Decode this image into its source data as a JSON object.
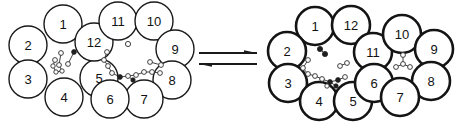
{
  "figure": {
    "kind": "chemical-equilibrium-diagram",
    "background_color": "#ffffff",
    "ink_color": "#111111"
  },
  "equilibrium": {
    "name": "equilibrium-arrows",
    "forward_arrow_label": "",
    "reverse_arrow_label": "",
    "forward_direction": "right",
    "reverse_direction": "left",
    "arrow_color": "#1a1a1a"
  },
  "left_cluster": {
    "name": "left-structure",
    "stroke_width": 1.4,
    "stroke_color": "#1a1a1a",
    "fill_color": "#ffffff",
    "label_font_size": 13,
    "circles": [
      {
        "label": "1",
        "cx": 63,
        "cy": 24,
        "r": 19
      },
      {
        "label": "2",
        "cx": 28,
        "cy": 45,
        "r": 19
      },
      {
        "label": "3",
        "cx": 28,
        "cy": 79,
        "r": 19
      },
      {
        "label": "4",
        "cx": 64,
        "cy": 97,
        "r": 19
      },
      {
        "label": "5",
        "cx": 99,
        "cy": 78,
        "r": 19
      },
      {
        "label": "12",
        "cx": 94,
        "cy": 42,
        "r": 19
      },
      {
        "label": "11",
        "cx": 118,
        "cy": 21,
        "r": 19
      },
      {
        "label": "10",
        "cx": 154,
        "cy": 21,
        "r": 19
      },
      {
        "label": "9",
        "cx": 175,
        "cy": 49,
        "r": 19
      },
      {
        "label": "8",
        "cx": 172,
        "cy": 80,
        "r": 19
      },
      {
        "label": "7",
        "cx": 144,
        "cy": 99,
        "r": 19
      },
      {
        "label": "6",
        "cx": 110,
        "cy": 99,
        "r": 19
      }
    ]
  },
  "right_cluster": {
    "name": "right-structure",
    "stroke_width": 2.6,
    "stroke_color": "#141414",
    "fill_color": "#ffffff",
    "label_font_size": 13,
    "circles": [
      {
        "label": "1",
        "cx": 315,
        "cy": 26,
        "r": 19
      },
      {
        "label": "12",
        "cx": 351,
        "cy": 25,
        "r": 19
      },
      {
        "label": "2",
        "cx": 287,
        "cy": 51,
        "r": 19
      },
      {
        "label": "3",
        "cx": 288,
        "cy": 83,
        "r": 19
      },
      {
        "label": "4",
        "cx": 319,
        "cy": 101,
        "r": 19
      },
      {
        "label": "5",
        "cx": 353,
        "cy": 101,
        "r": 19
      },
      {
        "label": "11",
        "cx": 373,
        "cy": 52,
        "r": 19
      },
      {
        "label": "6",
        "cx": 374,
        "cy": 83,
        "r": 19
      },
      {
        "label": "10",
        "cx": 402,
        "cy": 34,
        "r": 19
      },
      {
        "label": "9",
        "cx": 434,
        "cy": 49,
        "r": 19
      },
      {
        "label": "8",
        "cx": 431,
        "cy": 81,
        "r": 19
      },
      {
        "label": "7",
        "cx": 400,
        "cy": 97,
        "r": 19
      }
    ]
  },
  "left_cavities": [
    {
      "name": "left-cavity-small",
      "nodes": [
        {
          "x": 61,
          "y": 53,
          "r": 2.4,
          "dark": false
        },
        {
          "x": 74,
          "y": 52,
          "r": 2.4,
          "dark": true
        },
        {
          "x": 55,
          "y": 60,
          "r": 2.4,
          "dark": false
        },
        {
          "x": 59,
          "y": 65,
          "r": 2.4,
          "dark": false
        },
        {
          "x": 53,
          "y": 66,
          "r": 2.2,
          "dark": false
        },
        {
          "x": 68,
          "y": 64,
          "r": 2.4,
          "dark": false
        },
        {
          "x": 56,
          "y": 72,
          "r": 2.2,
          "dark": false
        },
        {
          "x": 62,
          "y": 71,
          "r": 2.2,
          "dark": false
        }
      ],
      "bonds": [
        {
          "x1": 61,
          "y1": 53,
          "x2": 59,
          "y2": 65
        },
        {
          "x1": 74,
          "y1": 52,
          "x2": 68,
          "y2": 64
        },
        {
          "x1": 55,
          "y1": 60,
          "x2": 53,
          "y2": 66
        },
        {
          "x1": 53,
          "y1": 66,
          "x2": 56,
          "y2": 72
        },
        {
          "x1": 56,
          "y1": 72,
          "x2": 62,
          "y2": 71
        },
        {
          "x1": 59,
          "y1": 65,
          "x2": 62,
          "y2": 71
        }
      ]
    },
    {
      "name": "left-cavity-large",
      "nodes": [
        {
          "x": 128,
          "y": 44,
          "r": 2.6,
          "dark": false
        },
        {
          "x": 150,
          "y": 62,
          "r": 2.4,
          "dark": false
        },
        {
          "x": 161,
          "y": 65,
          "r": 2.4,
          "dark": false
        },
        {
          "x": 107,
          "y": 52,
          "r": 2.4,
          "dark": false
        },
        {
          "x": 104,
          "y": 60,
          "r": 2.4,
          "dark": false
        },
        {
          "x": 108,
          "y": 66,
          "r": 2.4,
          "dark": false
        },
        {
          "x": 112,
          "y": 73,
          "r": 2.4,
          "dark": false
        },
        {
          "x": 120,
          "y": 77,
          "r": 2.4,
          "dark": true
        },
        {
          "x": 128,
          "y": 76,
          "r": 2.4,
          "dark": false
        },
        {
          "x": 136,
          "y": 75,
          "r": 2.4,
          "dark": false
        },
        {
          "x": 144,
          "y": 72,
          "r": 2.4,
          "dark": false
        },
        {
          "x": 152,
          "y": 72,
          "r": 2.4,
          "dark": false
        },
        {
          "x": 160,
          "y": 73,
          "r": 2.4,
          "dark": false
        },
        {
          "x": 133,
          "y": 80,
          "r": 2.2,
          "dark": true
        }
      ],
      "bonds": [
        {
          "x1": 107,
          "y1": 52,
          "x2": 104,
          "y2": 60
        },
        {
          "x1": 104,
          "y1": 60,
          "x2": 108,
          "y2": 66
        },
        {
          "x1": 108,
          "y1": 66,
          "x2": 112,
          "y2": 73
        },
        {
          "x1": 112,
          "y1": 73,
          "x2": 120,
          "y2": 77
        },
        {
          "x1": 120,
          "y1": 77,
          "x2": 128,
          "y2": 76
        },
        {
          "x1": 128,
          "y1": 76,
          "x2": 136,
          "y2": 75
        },
        {
          "x1": 136,
          "y1": 75,
          "x2": 144,
          "y2": 72
        },
        {
          "x1": 144,
          "y1": 72,
          "x2": 152,
          "y2": 72
        },
        {
          "x1": 152,
          "y1": 72,
          "x2": 160,
          "y2": 73
        },
        {
          "x1": 150,
          "y1": 62,
          "x2": 161,
          "y2": 65
        },
        {
          "x1": 128,
          "y1": 76,
          "x2": 133,
          "y2": 80
        }
      ]
    }
  ],
  "right_cavities": [
    {
      "name": "right-cavity-large",
      "nodes": [
        {
          "x": 320,
          "y": 49,
          "r": 2.6,
          "dark": true
        },
        {
          "x": 325,
          "y": 54,
          "r": 2.6,
          "dark": true
        },
        {
          "x": 308,
          "y": 60,
          "r": 2.4,
          "dark": false
        },
        {
          "x": 303,
          "y": 68,
          "r": 2.4,
          "dark": false
        },
        {
          "x": 308,
          "y": 74,
          "r": 2.4,
          "dark": false
        },
        {
          "x": 315,
          "y": 76,
          "r": 2.4,
          "dark": false
        },
        {
          "x": 322,
          "y": 79,
          "r": 2.4,
          "dark": false
        },
        {
          "x": 330,
          "y": 82,
          "r": 2.4,
          "dark": true
        },
        {
          "x": 338,
          "y": 80,
          "r": 2.4,
          "dark": true
        },
        {
          "x": 345,
          "y": 77,
          "r": 2.4,
          "dark": false
        },
        {
          "x": 340,
          "y": 66,
          "r": 2.4,
          "dark": false
        },
        {
          "x": 347,
          "y": 63,
          "r": 2.4,
          "dark": false
        },
        {
          "x": 336,
          "y": 86,
          "r": 2.2,
          "dark": true
        },
        {
          "x": 327,
          "y": 86,
          "r": 2.2,
          "dark": false
        }
      ],
      "bonds": [
        {
          "x1": 320,
          "y1": 49,
          "x2": 325,
          "y2": 54
        },
        {
          "x1": 308,
          "y1": 60,
          "x2": 303,
          "y2": 68
        },
        {
          "x1": 303,
          "y1": 68,
          "x2": 308,
          "y2": 74
        },
        {
          "x1": 308,
          "y1": 74,
          "x2": 315,
          "y2": 76
        },
        {
          "x1": 315,
          "y1": 76,
          "x2": 322,
          "y2": 79
        },
        {
          "x1": 322,
          "y1": 79,
          "x2": 330,
          "y2": 82
        },
        {
          "x1": 330,
          "y1": 82,
          "x2": 338,
          "y2": 80
        },
        {
          "x1": 338,
          "y1": 80,
          "x2": 345,
          "y2": 77
        },
        {
          "x1": 340,
          "y1": 66,
          "x2": 347,
          "y2": 63
        },
        {
          "x1": 330,
          "y1": 82,
          "x2": 336,
          "y2": 86
        },
        {
          "x1": 327,
          "y1": 86,
          "x2": 330,
          "y2": 82
        }
      ]
    },
    {
      "name": "right-cavity-small",
      "nodes": [
        {
          "x": 403,
          "y": 55,
          "r": 2.4,
          "dark": false
        },
        {
          "x": 403,
          "y": 64,
          "r": 2.4,
          "dark": false
        },
        {
          "x": 396,
          "y": 67,
          "r": 2.4,
          "dark": false
        },
        {
          "x": 410,
          "y": 67,
          "r": 2.4,
          "dark": false
        }
      ],
      "bonds": [
        {
          "x1": 403,
          "y1": 55,
          "x2": 403,
          "y2": 64
        },
        {
          "x1": 403,
          "y1": 64,
          "x2": 396,
          "y2": 67
        },
        {
          "x1": 403,
          "y1": 64,
          "x2": 410,
          "y2": 67
        }
      ]
    }
  ]
}
